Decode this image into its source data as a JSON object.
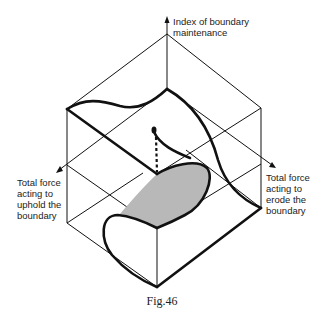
{
  "figure": {
    "caption": "Fig.46",
    "axes": {
      "vertical": "Index of boundary\nmaintenance",
      "left": "Total force\nacting to\nuphold the\nboundary",
      "right": "Total force\nacting to\nerode the\nboundary"
    },
    "colors": {
      "line": "#111111",
      "shade": "#b8b8b8",
      "background": "#ffffff"
    }
  }
}
